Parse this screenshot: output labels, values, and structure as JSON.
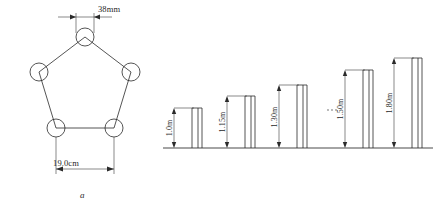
{
  "figure": {
    "panel_a": {
      "caption": "a",
      "shape": "pentagon",
      "node_count": 5,
      "dimensions": [
        {
          "name": "top-width",
          "label": "38mm",
          "value": 38,
          "unit": "mm"
        },
        {
          "name": "bottom-width",
          "label": "19.0cm",
          "value": 19.0,
          "unit": "cm"
        }
      ]
    },
    "panel_b": {
      "caption": "b",
      "ellipsis": "⋯",
      "posts": [
        {
          "label": "1.0m",
          "value": 1.0,
          "unit": "m"
        },
        {
          "label": "1.15m",
          "value": 1.15,
          "unit": "m"
        },
        {
          "label": "1.30m",
          "value": 1.3,
          "unit": "m"
        },
        {
          "label": "1.50m",
          "value": 1.5,
          "unit": "m"
        },
        {
          "label": "1.80m",
          "value": 1.8,
          "unit": "m"
        }
      ]
    }
  },
  "colors": {
    "ink": "#2a2a2a",
    "baseline": "#4a4a4a",
    "paper": "#ffffff"
  }
}
